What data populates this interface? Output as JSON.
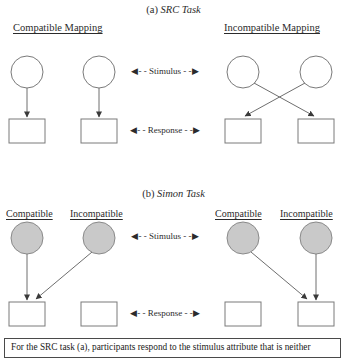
{
  "figure": {
    "sections": [
      {
        "id": "src",
        "prefix": "(a)",
        "title": "SRC Task"
      },
      {
        "id": "simon",
        "prefix": "(b)",
        "title": "Simon Task"
      }
    ],
    "src_panels": [
      {
        "id": "src-compatible",
        "label": "Compatible Mapping"
      },
      {
        "id": "src-incompatible",
        "label": "Incompatible Mapping"
      }
    ],
    "simon_headers": [
      {
        "id": "simon-left-compatible",
        "label": "Compatible"
      },
      {
        "id": "simon-left-incompatible",
        "label": "Incompatible"
      },
      {
        "id": "simon-right-compatible",
        "label": "Compatible"
      },
      {
        "id": "simon-right-incompatible",
        "label": "Incompatible"
      }
    ],
    "axis_labels": [
      {
        "id": "src-stimulus",
        "label": "Stimulus"
      },
      {
        "id": "src-response",
        "label": "Response"
      },
      {
        "id": "simon-stimulus",
        "label": "Stimulus"
      },
      {
        "id": "simon-response",
        "label": "Response"
      }
    ],
    "caption": "For the SRC task (a), participants respond to the stimulus attribute that is neither",
    "colors": {
      "stroke": "#6e6e6e",
      "arrow": "#4a4a4a",
      "circle_fill_src": "#ffffff",
      "circle_fill_simon": "#c9c9c9",
      "box_fill": "#ffffff",
      "text": "#2b2b2b",
      "caption_border": "#4a4a4a"
    },
    "glyphs": {
      "arrow_left": "◀",
      "arrow_right": "▶",
      "dash": "- -"
    }
  }
}
